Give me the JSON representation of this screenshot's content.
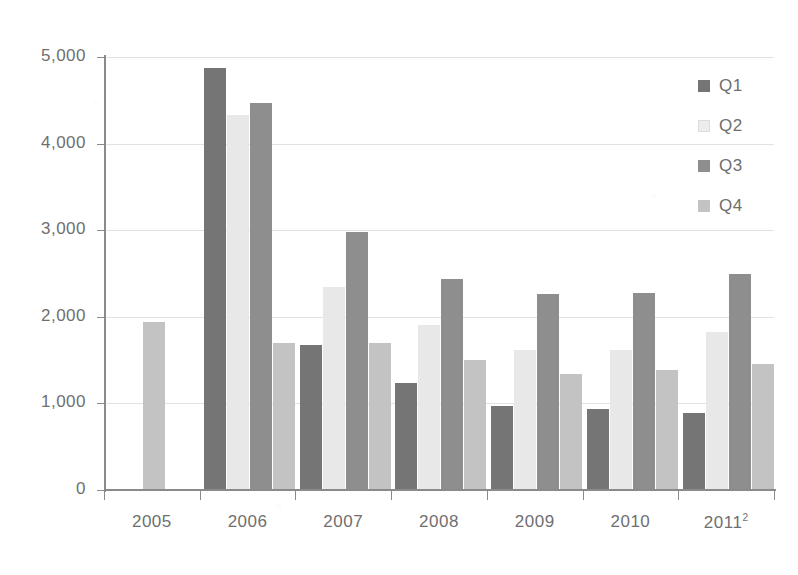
{
  "chart_data": {
    "type": "bar",
    "title": "",
    "subtitle": "",
    "xlabel": "",
    "ylabel": "",
    "categories": [
      "2005",
      "2006",
      "2007",
      "2008",
      "2009",
      "2010",
      "2011"
    ],
    "category_notes": {
      "2011": "2"
    },
    "series": [
      {
        "name": "Q1",
        "color": "#757575",
        "values": [
          null,
          4870,
          1680,
          1235,
          965,
          940,
          890
        ]
      },
      {
        "name": "Q2",
        "color": "#e8e8e8",
        "values": [
          null,
          4330,
          2350,
          1900,
          1620,
          1620,
          1830
        ]
      },
      {
        "name": "Q3",
        "color": "#8e8e8e",
        "values": [
          null,
          4470,
          2980,
          2440,
          2260,
          2280,
          2500
        ]
      },
      {
        "name": "Q4",
        "color": "#c3c3c3",
        "values": [
          1935,
          1700,
          1700,
          1500,
          1345,
          1390,
          1450
        ]
      }
    ],
    "ylim": [
      0,
      5000
    ],
    "yticks": [
      0,
      1000,
      2000,
      3000,
      4000,
      5000
    ],
    "ytick_labels": [
      "0",
      "1,000",
      "2,000",
      "3,000",
      "4,000",
      "5,000"
    ],
    "grid": true,
    "grid_axis": "y",
    "legend_position": "right",
    "legend_entries": [
      "Q1",
      "Q2",
      "Q3",
      "Q4"
    ]
  },
  "axis": {
    "y_tick_labels": [
      "5,000",
      "4,000",
      "3,000",
      "2,000",
      "1,000",
      "0"
    ],
    "x_tick_labels": [
      "2005",
      "2006",
      "2007",
      "2008",
      "2009",
      "2010",
      "2011"
    ],
    "footnote_marker": "2"
  },
  "legend": {
    "items": [
      {
        "label": "Q1",
        "swatch": "q1"
      },
      {
        "label": "Q2",
        "swatch": "q2"
      },
      {
        "label": "Q3",
        "swatch": "q3"
      },
      {
        "label": "Q4",
        "swatch": "q4"
      }
    ]
  }
}
